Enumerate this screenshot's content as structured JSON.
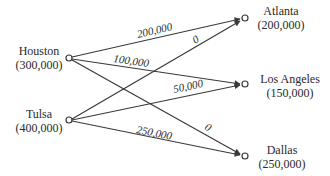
{
  "diagram": {
    "type": "transportation-network",
    "sources": [
      {
        "id": "houston",
        "name": "Houston",
        "supply": "(300,000)"
      },
      {
        "id": "tulsa",
        "name": "Tulsa",
        "supply": "(400,000)"
      }
    ],
    "destinations": [
      {
        "id": "atlanta",
        "name": "Atlanta",
        "demand": "(200,000)"
      },
      {
        "id": "losangeles",
        "name": "Los Angeles",
        "demand": "(150,000)"
      },
      {
        "id": "dallas",
        "name": "Dallas",
        "demand": "(250,000)"
      }
    ],
    "edges": [
      {
        "from": "houston",
        "to": "atlanta",
        "flow": "200,000"
      },
      {
        "from": "houston",
        "to": "losangeles",
        "flow": "100,000"
      },
      {
        "from": "houston",
        "to": "dallas",
        "flow": "0"
      },
      {
        "from": "tulsa",
        "to": "atlanta",
        "flow": "0"
      },
      {
        "from": "tulsa",
        "to": "losangeles",
        "flow": "50,000"
      },
      {
        "from": "tulsa",
        "to": "dallas",
        "flow": "250,000"
      }
    ],
    "colors": {
      "line": "#3a3a3a",
      "text": "#2a2a2a",
      "background": "#ffffff"
    }
  }
}
